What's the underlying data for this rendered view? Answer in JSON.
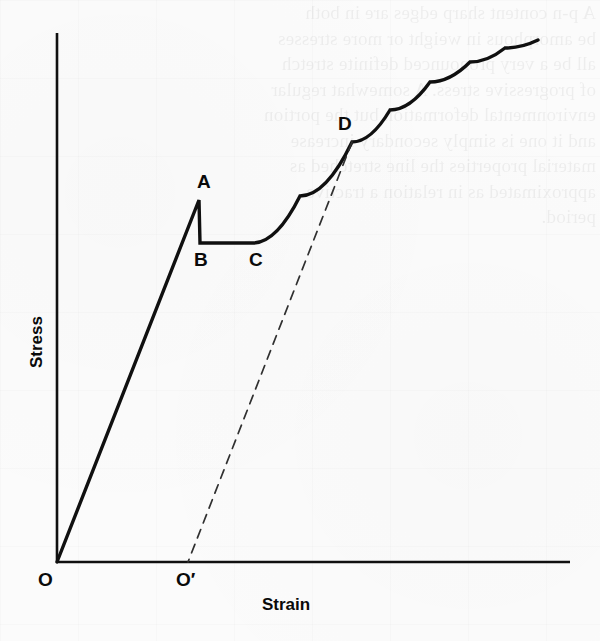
{
  "figure": {
    "kind": "stress-strain-diagram",
    "background_color": "#fbfbfb",
    "ink_color": "#101010",
    "ghost_text": "A p-n content sharp edges are in both\nbe amorphous in weight or more stresses\nall be a very pronounced definite stretch\nof progressive stress. A somewhat regular\nenvironmental deformation but the portion\nand it one is simply secondary increase\nmaterial properties the line stretched as\napproximated as in relation a tractive\nperiod."
  },
  "chart_data": {
    "type": "line",
    "title": "",
    "subtitle": "",
    "xlabel": "Strain",
    "ylabel": "Stress",
    "grid": false,
    "legend": null,
    "xlim": [
      0,
      1
    ],
    "ylim": [
      0,
      1
    ],
    "axis_ticks": {
      "x": [],
      "y": []
    },
    "axes": {
      "origin_label": "O",
      "x_axis_start": [
        57,
        562
      ],
      "x_axis_end": [
        570,
        562
      ],
      "y_axis_start": [
        57,
        562
      ],
      "y_axis_end": [
        57,
        33
      ]
    },
    "series": [
      {
        "name": "Stress-strain curve",
        "style": "solid",
        "linewidth": 3.4,
        "color": "#101010",
        "points": [
          [
            57,
            562
          ],
          [
            199,
            200
          ],
          [
            200,
            243
          ],
          [
            253,
            243
          ],
          [
            300,
            196
          ],
          [
            352,
            142
          ],
          [
            390,
            110
          ],
          [
            430,
            82
          ],
          [
            470,
            62
          ],
          [
            505,
            48
          ],
          [
            538,
            40
          ]
        ]
      },
      {
        "name": "Elastic unloading line (permanent set)",
        "style": "dashed",
        "linewidth": 1.7,
        "color": "#303030",
        "dasharray": "9 7",
        "points": [
          [
            352,
            142
          ],
          [
            188,
            562
          ]
        ]
      }
    ],
    "annotations": [
      {
        "id": "A",
        "label": "A",
        "desc": "upper yield point",
        "point": [
          199,
          200
        ],
        "label_x": 197,
        "label_y": 172
      },
      {
        "id": "B",
        "label": "B",
        "desc": "lower yield point",
        "point": [
          200,
          243
        ],
        "label_x": 194,
        "label_y": 250
      },
      {
        "id": "C",
        "label": "C",
        "desc": "end of yield plateau",
        "point": [
          253,
          243
        ],
        "label_x": 249,
        "label_y": 250
      },
      {
        "id": "D",
        "label": "D",
        "desc": "unloading point",
        "point": [
          352,
          142
        ],
        "label_x": 338,
        "label_y": 114
      },
      {
        "id": "O",
        "label": "O",
        "desc": "origin",
        "point": [
          57,
          562
        ],
        "label_x": 38,
        "label_y": 570
      },
      {
        "id": "Op",
        "label": "O′",
        "desc": "permanent set origin",
        "point": [
          188,
          562
        ],
        "label_x": 176,
        "label_y": 570
      }
    ]
  },
  "axis_titles": {
    "x": "Strain",
    "y": "Stress",
    "x_pos": {
      "x": 262,
      "y": 596
    },
    "y_pos": {
      "x": 28,
      "y": 368
    }
  }
}
